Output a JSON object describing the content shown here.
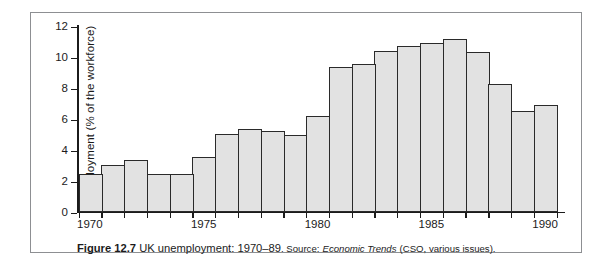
{
  "figure": {
    "caption_figure_number": "Figure 12.7",
    "caption_title": "UK unemployment: 1970–89",
    "caption_source_label": ". Source:",
    "caption_source_title": "Economic Trends",
    "caption_source_rest": "(CSO, various issues)."
  },
  "colors": {
    "bar_fill": "#e2e2e2",
    "bar_stroke": "#2a2a2a",
    "axis": "#1b1b1b",
    "frame": "#8d8f92",
    "background": "#ffffff"
  },
  "chart_data": {
    "type": "bar",
    "title": "UK unemployment: 1970–89",
    "xlabel": "",
    "ylabel": "Unemployment (% of the workforce)",
    "ylim": [
      0,
      12
    ],
    "yticks": [
      0,
      2,
      4,
      6,
      8,
      10,
      12
    ],
    "ytick_labels": [
      "0",
      "2",
      "4",
      "6",
      "8",
      "10",
      "12"
    ],
    "xticks": [
      1970,
      1975,
      1980,
      1985,
      1990
    ],
    "xtick_labels": [
      "1970",
      "1975",
      "1980",
      "1985",
      "1990"
    ],
    "xlim": [
      1969.5,
      1990.5
    ],
    "grid": false,
    "legend": false,
    "categories": [
      "1970",
      "1971",
      "1972",
      "1973",
      "1974",
      "1975",
      "1976",
      "1977",
      "1978",
      "1979",
      "1980",
      "1981",
      "1982",
      "1983",
      "1984",
      "1985",
      "1986",
      "1987",
      "1988",
      "1989",
      "1990"
    ],
    "values": [
      2.45,
      3.0,
      3.3,
      2.4,
      2.4,
      3.5,
      5.0,
      5.3,
      5.2,
      4.95,
      6.15,
      9.35,
      9.5,
      10.35,
      10.65,
      10.85,
      11.1,
      10.3,
      8.25,
      6.5,
      6.85
    ]
  }
}
